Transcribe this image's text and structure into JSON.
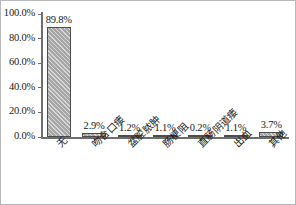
{
  "chart_data": {
    "type": "bar",
    "title": "",
    "subtitle": "",
    "xlabel": "",
    "ylabel": "",
    "ylim": [
      0,
      100
    ],
    "grid": false,
    "legend": "none",
    "y_ticks": [
      "0.0%",
      "20.0%",
      "40.0%",
      "60.0%",
      "80.0%",
      "100.0%"
    ],
    "y_tick_values": [
      0,
      20,
      40,
      60,
      80,
      100
    ],
    "categories": [
      "无",
      "吻合口瘘",
      "盆腔脓肿",
      "肠梗阻",
      "直肠阴道瘘",
      "出血",
      "其他"
    ],
    "values": [
      89.8,
      2.9,
      1.2,
      1.1,
      0.2,
      1.1,
      3.7
    ],
    "data_labels": [
      "89.8%",
      "2.9%",
      "1.2%",
      "1.1%",
      "0.2%",
      "1.1%",
      "3.7%"
    ],
    "series": [
      {
        "name": "",
        "values": [
          89.8,
          2.9,
          1.2,
          1.1,
          0.2,
          1.1,
          3.7
        ]
      }
    ]
  },
  "style": {
    "bar_fill": "#a6a6a6",
    "bar_border": "#4d4d4d",
    "axis_color": "#6e6e6e",
    "text_color": "#1a1a1a",
    "frame_border": "#b9b9b9",
    "background": "#ffffff"
  }
}
